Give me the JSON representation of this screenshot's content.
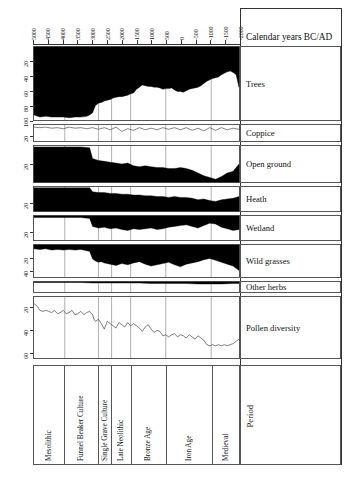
{
  "figure": {
    "axis_title": "Calendar years BC/AD",
    "period_axis_label": "Period"
  },
  "chart_data": {
    "type": "area",
    "title": "Calendar years BC/AD",
    "xlabel": "Calendar years BC/AD",
    "ylabel": "Percentage",
    "grid": true,
    "legend_position": "right",
    "x_axis": {
      "label": "Calendar years BC/AD",
      "ticks": [
        "5000",
        "4500",
        "4000",
        "3500",
        "3000",
        "2500",
        "2000",
        "1500",
        "1000",
        "500",
        "0",
        "-500",
        "-1000",
        "-1500",
        "-2000"
      ],
      "range": [
        5000,
        -2000
      ],
      "note": "positive = BC, negative = AD"
    },
    "panels": [
      {
        "name": "Trees",
        "label": "Trees",
        "fill": "from-top",
        "ylim": [
          0,
          100
        ],
        "yticks": [
          20,
          40,
          60,
          80,
          100
        ],
        "x": [
          5000,
          4800,
          4600,
          4400,
          4200,
          4000,
          3800,
          3600,
          3400,
          3200,
          3100,
          3000,
          2900,
          2800,
          2700,
          2600,
          2500,
          2400,
          2300,
          2200,
          2100,
          2000,
          1900,
          1800,
          1700,
          1600,
          1500,
          1400,
          1300,
          1200,
          1100,
          1000,
          900,
          800,
          700,
          600,
          500,
          400,
          300,
          200,
          100,
          0,
          -100,
          -200,
          -300,
          -400,
          -500,
          -600,
          -700,
          -800,
          -900,
          -1000,
          -1100,
          -1200,
          -1300,
          -1400,
          -1500,
          -1600,
          -1700,
          -1800,
          -1900,
          -2000
        ],
        "values": [
          93,
          96,
          95,
          96,
          96,
          96,
          97,
          96,
          96,
          95,
          93,
          90,
          80,
          77,
          76,
          74,
          73,
          72,
          70,
          69,
          68,
          68,
          67,
          66,
          64,
          63,
          58,
          55,
          52,
          53,
          54,
          54,
          55,
          55,
          56,
          58,
          57,
          57,
          56,
          59,
          61,
          61,
          62,
          60,
          58,
          57,
          56,
          55,
          53,
          50,
          47,
          45,
          43,
          42,
          41,
          38,
          36,
          34,
          33,
          35,
          38,
          55
        ]
      },
      {
        "name": "Coppice",
        "label": "Coppice",
        "fill": "line",
        "ylim": [
          0,
          30
        ],
        "yticks": [
          20
        ],
        "x": [
          5000,
          4800,
          4600,
          4400,
          4200,
          4000,
          3800,
          3600,
          3400,
          3200,
          3000,
          2800,
          2600,
          2400,
          2200,
          2000,
          1800,
          1600,
          1400,
          1200,
          1000,
          800,
          600,
          400,
          200,
          0,
          -200,
          -400,
          -600,
          -800,
          -1000,
          -1200,
          -1400,
          -1600,
          -1800,
          -2000
        ],
        "values": [
          4,
          5,
          4,
          6,
          5,
          7,
          4,
          6,
          5,
          7,
          5,
          8,
          5,
          9,
          4,
          12,
          7,
          10,
          5,
          9,
          6,
          9,
          5,
          8,
          5,
          9,
          5,
          10,
          6,
          11,
          5,
          10,
          5,
          9,
          6,
          8
        ]
      },
      {
        "name": "Open ground",
        "label": "Open ground",
        "fill": "from-bottom",
        "ylim": [
          0,
          40
        ],
        "yticks": [
          20
        ],
        "x": [
          5000,
          4600,
          4200,
          3800,
          3400,
          3100,
          3000,
          2800,
          2600,
          2400,
          2200,
          2000,
          1800,
          1600,
          1400,
          1200,
          1000,
          800,
          600,
          400,
          200,
          0,
          -200,
          -400,
          -600,
          -800,
          -1000,
          -1200,
          -1400,
          -1600,
          -1800,
          -2000
        ],
        "values": [
          1,
          1,
          1,
          1,
          1,
          2,
          14,
          16,
          17,
          18,
          19,
          20,
          19,
          22,
          23,
          22,
          23,
          24,
          24,
          25,
          25,
          24,
          25,
          27,
          30,
          33,
          35,
          37,
          34,
          30,
          28,
          20
        ]
      },
      {
        "name": "Heath",
        "label": "Heath",
        "fill": "from-bottom",
        "ylim": [
          0,
          30
        ],
        "yticks": [
          20
        ],
        "x": [
          5000,
          4600,
          4200,
          3800,
          3400,
          3100,
          3000,
          2800,
          2600,
          2400,
          2200,
          2000,
          1800,
          1600,
          1400,
          1200,
          1000,
          800,
          600,
          400,
          200,
          0,
          -200,
          -400,
          -600,
          -800,
          -1000,
          -1200,
          -1400,
          -1600,
          -1800,
          -2000
        ],
        "values": [
          1,
          1,
          1,
          1,
          1,
          1,
          6,
          7,
          7,
          8,
          8,
          9,
          9,
          10,
          10,
          11,
          11,
          12,
          12,
          13,
          12,
          13,
          13,
          14,
          16,
          15,
          17,
          18,
          16,
          15,
          14,
          12
        ]
      },
      {
        "name": "Wetland",
        "label": "Wetland",
        "fill": "from-top",
        "ylim": [
          0,
          30
        ],
        "yticks": [
          20
        ],
        "x": [
          5000,
          4600,
          4200,
          3800,
          3400,
          3100,
          3000,
          2800,
          2600,
          2400,
          2200,
          2000,
          1800,
          1600,
          1400,
          1200,
          1000,
          800,
          600,
          400,
          200,
          0,
          -200,
          -400,
          -600,
          -800,
          -1000,
          -1200,
          -1400,
          -1600,
          -1800,
          -2000
        ],
        "values": [
          2,
          2,
          2,
          2,
          2,
          3,
          13,
          15,
          14,
          16,
          15,
          17,
          18,
          16,
          17,
          16,
          15,
          17,
          16,
          14,
          13,
          12,
          11,
          13,
          15,
          12,
          9,
          10,
          14,
          16,
          18,
          17
        ]
      },
      {
        "name": "Wild grasses",
        "label": "Wild grasses",
        "fill": "from-top",
        "ylim": [
          0,
          50
        ],
        "yticks": [
          20,
          40
        ],
        "x": [
          5000,
          4800,
          4600,
          4400,
          4200,
          4000,
          3800,
          3600,
          3400,
          3200,
          3100,
          3000,
          2900,
          2800,
          2700,
          2600,
          2400,
          2200,
          2000,
          1800,
          1600,
          1400,
          1200,
          1000,
          800,
          600,
          400,
          200,
          0,
          -200,
          -400,
          -600,
          -800,
          -1000,
          -1200,
          -1400,
          -1600,
          -1800,
          -2000
        ],
        "values": [
          6,
          7,
          6,
          8,
          7,
          8,
          7,
          8,
          7,
          9,
          10,
          22,
          25,
          27,
          26,
          28,
          30,
          32,
          29,
          31,
          28,
          26,
          30,
          33,
          31,
          29,
          27,
          31,
          34,
          30,
          28,
          26,
          23,
          21,
          24,
          27,
          30,
          33,
          40
        ]
      },
      {
        "name": "Other herbs",
        "label": "Other herbs",
        "fill": "from-top",
        "ylim": [
          0,
          20
        ],
        "yticks": [],
        "x": [
          5000,
          4600,
          4200,
          3800,
          3400,
          3000,
          2600,
          2200,
          1800,
          1400,
          1000,
          600,
          200,
          -200,
          -600,
          -1000,
          -1400,
          -1800,
          -2000
        ],
        "values": [
          1,
          1,
          1,
          1,
          1,
          2,
          2,
          2,
          2,
          2,
          3,
          3,
          3,
          3,
          4,
          4,
          4,
          3,
          3
        ]
      },
      {
        "name": "Pollen diversity",
        "label": "Pollen diversity",
        "fill": "line",
        "ylim": [
          10,
          65
        ],
        "yticks": [
          20,
          40,
          60
        ],
        "x": [
          5000,
          4900,
          4800,
          4700,
          4600,
          4500,
          4400,
          4300,
          4200,
          4100,
          4000,
          3900,
          3800,
          3700,
          3600,
          3500,
          3400,
          3300,
          3200,
          3100,
          3000,
          2950,
          2900,
          2800,
          2700,
          2600,
          2500,
          2400,
          2300,
          2200,
          2100,
          2000,
          1900,
          1800,
          1700,
          1600,
          1500,
          1400,
          1300,
          1200,
          1100,
          1000,
          900,
          800,
          700,
          600,
          500,
          400,
          300,
          200,
          100,
          0,
          -100,
          -200,
          -300,
          -400,
          -500,
          -600,
          -700,
          -800,
          -900,
          -1000,
          -1100,
          -1200,
          -1300,
          -1400,
          -1500,
          -1600,
          -1700,
          -1800,
          -1900,
          -2000
        ],
        "values": [
          16,
          18,
          22,
          23,
          22,
          23,
          24,
          22,
          25,
          24,
          22,
          25,
          24,
          22,
          26,
          25,
          23,
          26,
          24,
          23,
          26,
          30,
          32,
          30,
          34,
          39,
          32,
          34,
          36,
          38,
          33,
          35,
          37,
          33,
          36,
          34,
          36,
          38,
          41,
          37,
          35,
          39,
          42,
          40,
          41,
          45,
          44,
          46,
          44,
          43,
          46,
          44,
          45,
          47,
          44,
          46,
          48,
          45,
          47,
          49,
          53,
          54,
          53,
          54,
          53,
          54,
          53,
          54,
          53,
          52,
          50,
          48
        ]
      }
    ],
    "periods": [
      {
        "label": "Mesolithic",
        "start": 5000,
        "end": 3950
      },
      {
        "label": "Funnel Beaker Culture",
        "start": 3950,
        "end": 2800
      },
      {
        "label": "Single Grave Culture",
        "start": 2800,
        "end": 2350
      },
      {
        "label": "Late Neolithic",
        "start": 2350,
        "end": 1700
      },
      {
        "label": "Bronze Age",
        "start": 1700,
        "end": 500
      },
      {
        "label": "Iron Age",
        "start": 500,
        "end": -1050
      },
      {
        "label": "Medieval",
        "start": -1050,
        "end": -2000
      }
    ]
  }
}
